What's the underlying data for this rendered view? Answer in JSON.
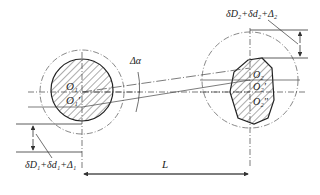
{
  "diagram": {
    "type": "two-shaft alignment tolerance schematic",
    "colors": {
      "line": "#333333",
      "hatch": "#444444",
      "background": "#ffffff"
    },
    "labels": {
      "delta_alpha": "Δα",
      "top_right_tolerance": "δD₂+δd₂+Δ₂",
      "bottom_left_tolerance": "δD₁+δd₁+Δ₁",
      "distance": "L",
      "left_center_upper": "O₁",
      "left_center_lower": "O₁'",
      "right_center_upper": "O₂",
      "right_center_middle": "O₂'",
      "right_center_lower": "O₂''"
    }
  }
}
